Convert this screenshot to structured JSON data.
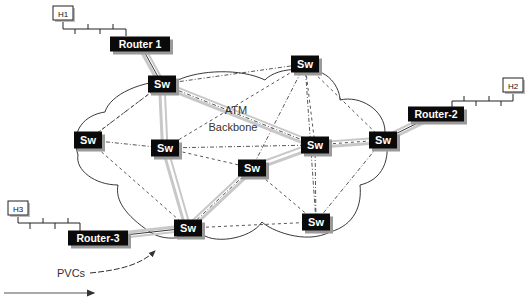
{
  "diagram": {
    "title": "ATM Backbone",
    "backbone_label_line1": "ATM",
    "backbone_label_line2": "Backbone",
    "pvc_label": "PVCs",
    "hosts": [
      {
        "id": "H1",
        "label": "H1"
      },
      {
        "id": "H2",
        "label": "H2"
      },
      {
        "id": "H3",
        "label": "H3"
      }
    ],
    "routers": [
      {
        "id": "R1",
        "label": "Router 1",
        "host": "H1",
        "switch": "S1"
      },
      {
        "id": "R2",
        "label": "Router-2",
        "host": "H2",
        "switch": "S7"
      },
      {
        "id": "R3",
        "label": "Router-3",
        "host": "H3",
        "switch": "S8"
      }
    ],
    "switches": [
      {
        "id": "S1",
        "label": "Sw"
      },
      {
        "id": "S2",
        "label": "Sw"
      },
      {
        "id": "S3",
        "label": "Sw"
      },
      {
        "id": "S4",
        "label": "Sw"
      },
      {
        "id": "S5",
        "label": "Sw"
      },
      {
        "id": "S6",
        "label": "Sw"
      },
      {
        "id": "S7",
        "label": "Sw"
      },
      {
        "id": "S8",
        "label": "Sw"
      },
      {
        "id": "S9",
        "label": "Sw"
      }
    ],
    "pvc_links": [
      [
        "R1",
        "S1"
      ],
      [
        "S1",
        "S6"
      ],
      [
        "S6",
        "S7"
      ],
      [
        "S7",
        "R2"
      ],
      [
        "S1",
        "S4"
      ],
      [
        "S4",
        "S8"
      ],
      [
        "S8",
        "R3"
      ],
      [
        "S8",
        "S5"
      ],
      [
        "S5",
        "S6"
      ]
    ],
    "mesh_links": [
      [
        "S1",
        "S2"
      ],
      [
        "S1",
        "S3"
      ],
      [
        "S1",
        "S6"
      ],
      [
        "S2",
        "S4"
      ],
      [
        "S2",
        "S5"
      ],
      [
        "S2",
        "S6"
      ],
      [
        "S2",
        "S9"
      ],
      [
        "S2",
        "S7"
      ],
      [
        "S3",
        "S4"
      ],
      [
        "S3",
        "S8"
      ],
      [
        "S4",
        "S6"
      ],
      [
        "S4",
        "S5"
      ],
      [
        "S5",
        "S8"
      ],
      [
        "S5",
        "S9"
      ],
      [
        "S6",
        "S9"
      ],
      [
        "S6",
        "S7"
      ],
      [
        "S7",
        "S9"
      ],
      [
        "S8",
        "S9"
      ],
      [
        "S3",
        "S1"
      ]
    ],
    "colors": {
      "node_fill": "#0a0a0a",
      "node_shadow": "#9a9a9a",
      "pvc_line": "#c8c8c8",
      "mesh_line": "#444444",
      "cloud_line": "#222222"
    }
  }
}
